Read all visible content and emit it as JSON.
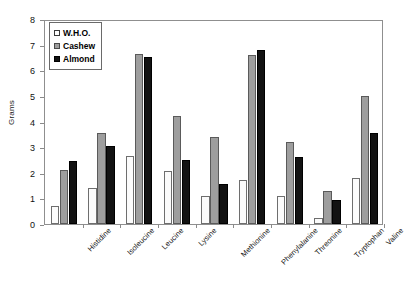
{
  "chart_data": {
    "type": "bar",
    "title": "",
    "xlabel": "",
    "ylabel": "Grams",
    "ylim": [
      0,
      8
    ],
    "yticks": [
      0,
      1,
      2,
      3,
      4,
      5,
      6,
      7,
      8
    ],
    "ytick_labels": [
      "0",
      "1",
      "2",
      "3",
      "4",
      "5",
      "6",
      "7",
      "8"
    ],
    "grid": false,
    "legend_position": "top-left",
    "categories": [
      "Histidine",
      "Isoleucine",
      "Leucine",
      "Lysine",
      "Methionine",
      "Phenylalanine",
      "Threonine",
      "Tryptophan",
      "Valine"
    ],
    "series": [
      {
        "name": "W.H.O.",
        "color": "#fbfbfb",
        "values": [
          0.7,
          1.4,
          2.65,
          2.05,
          1.1,
          1.7,
          1.1,
          0.25,
          1.8
        ]
      },
      {
        "name": "Cashew",
        "color": "#9e9e9e",
        "values": [
          2.1,
          3.55,
          6.65,
          4.2,
          3.4,
          6.6,
          3.2,
          1.3,
          5.0
        ]
      },
      {
        "name": "Almond",
        "color": "#121212",
        "values": [
          2.45,
          3.05,
          6.5,
          2.5,
          1.55,
          6.8,
          2.6,
          0.95,
          3.55
        ]
      }
    ]
  }
}
